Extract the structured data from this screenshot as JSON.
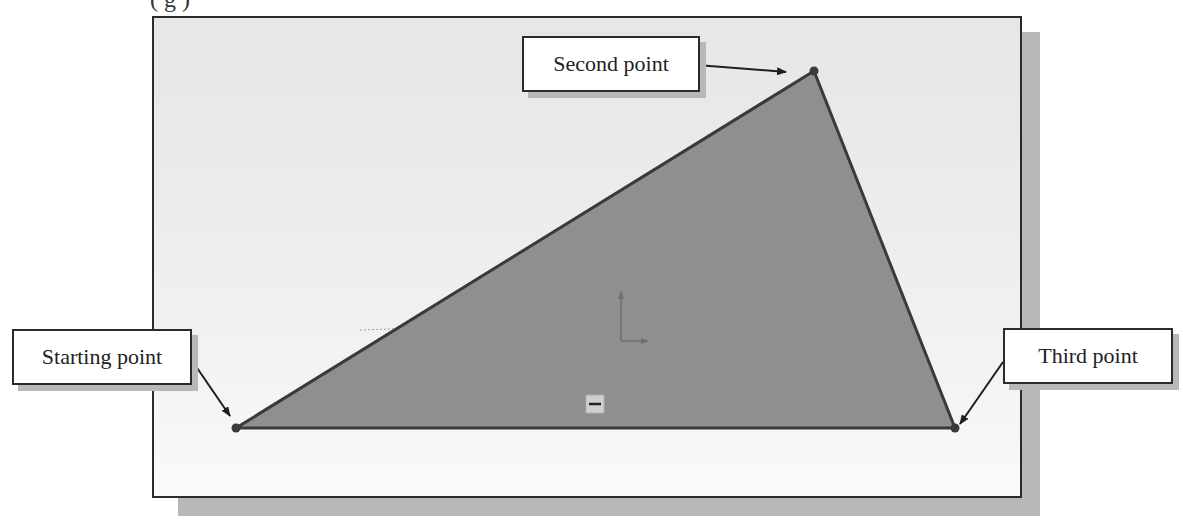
{
  "top_text_clipped": "(                                                                   g                                    )",
  "colors": {
    "triangle_fill": "#8f8f8f",
    "triangle_stroke": "#3a3a3a",
    "frame_border": "#2b2b2b",
    "shadow": "#b8b8b8"
  },
  "callouts": {
    "second_point": "Second point",
    "starting_point": "Starting point",
    "third_point": "Third point"
  },
  "triangle": {
    "starting_point": [
      236,
      428
    ],
    "second_point": [
      814,
      71
    ],
    "third_point": [
      955,
      428
    ]
  },
  "origin_icon": "coordinate-axes-icon",
  "sketch_relation_icon": "horizontal-relation-icon"
}
